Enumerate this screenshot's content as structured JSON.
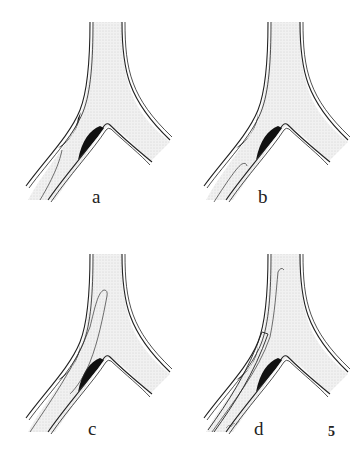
{
  "figure": {
    "number": "5",
    "panels": [
      {
        "id": "a",
        "label": "a"
      },
      {
        "id": "b",
        "label": "b"
      },
      {
        "id": "c",
        "label": "c"
      },
      {
        "id": "d",
        "label": "d"
      }
    ],
    "colors": {
      "lumen_fill": "#ebebeb",
      "wall": "#222222",
      "plaque": "#111111",
      "background": "#ffffff"
    }
  }
}
